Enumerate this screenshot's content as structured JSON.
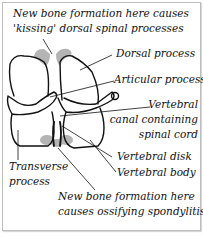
{
  "diagram": {
    "colors": {
      "outline": "#111111",
      "new_bone": "#a8a8a8",
      "frame": "#bdbdbd",
      "background": "#ffffff"
    },
    "labels": {
      "kissing_line1": "New bone formation here causes",
      "kissing_line2": "'kissing' dorsal spinal processes",
      "dorsal": "Dorsal process",
      "articular": "Articular process",
      "canal_line1": "Vertebral",
      "canal_line2": "canal containing",
      "canal_line3": "spinal cord",
      "disk": "Vertebral disk",
      "body": "Vertebral body",
      "transverse_line1": "Transverse",
      "transverse_line2": "process",
      "spondylitis_line1": "New bone formation here",
      "spondylitis_line2": "causes ossifying spondylitis"
    }
  }
}
